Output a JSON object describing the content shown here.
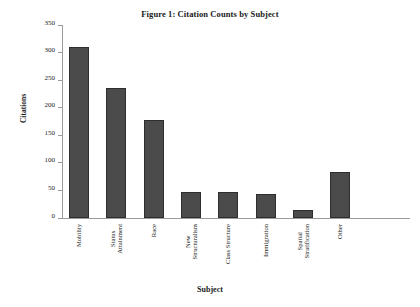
{
  "chart_data": {
    "type": "bar",
    "title": "Figure 1: Citation Counts by Subject",
    "xlabel": "Subject",
    "ylabel": "Citations",
    "categories": [
      "Mobility",
      "Status Attainment",
      "Race",
      "New Structuralism",
      "Class Structure",
      "Immigration",
      "Spatial Stratification",
      "Other"
    ],
    "category_lines": [
      [
        "Mobility"
      ],
      [
        "Status",
        "Attainment"
      ],
      [
        "Race"
      ],
      [
        "New",
        "Structuralism"
      ],
      [
        "Class Structure"
      ],
      [
        "Immigration"
      ],
      [
        "Spatial",
        "Stratification"
      ],
      [
        "Other"
      ]
    ],
    "values": [
      310,
      236,
      177,
      48,
      48,
      43,
      14,
      84
    ],
    "ylim": [
      0,
      350
    ],
    "ytick_values": [
      0,
      50,
      100,
      150,
      200,
      250,
      300,
      350
    ],
    "ytick_labels": [
      "0",
      "50",
      "100",
      "150",
      "200",
      "250",
      "300",
      "350"
    ],
    "grid": false,
    "legend": false,
    "bar_color": "#4b4b4b",
    "bar_edge_color": "#2e2e2e",
    "axis_color": "#9a9a9a",
    "background_color": "#ffffff"
  }
}
